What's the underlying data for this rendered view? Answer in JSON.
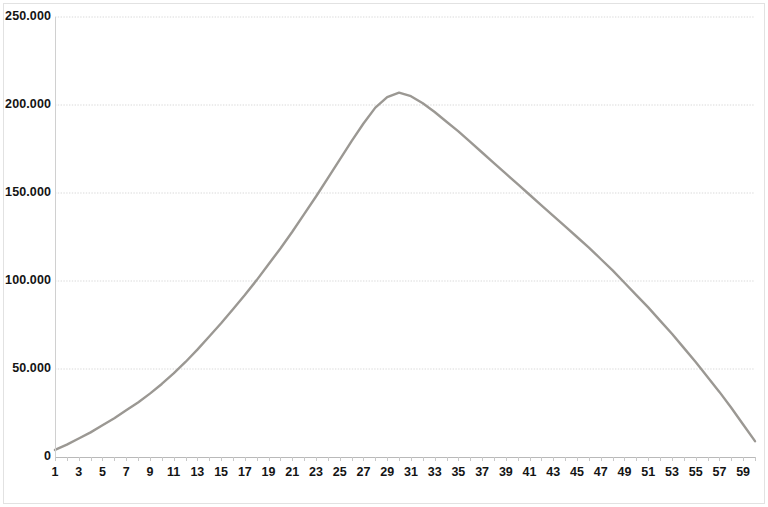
{
  "chart_data": {
    "type": "line",
    "title": "",
    "subtitle": "",
    "xlabel": "",
    "ylabel": "",
    "xlim": [
      1,
      60
    ],
    "ylim": [
      0,
      250000
    ],
    "grid": true,
    "legend": false,
    "legend_position": "none",
    "y_ticks": [
      0,
      50000,
      100000,
      150000,
      200000,
      250000
    ],
    "y_tick_labels": [
      "0",
      "50.000",
      "100.000",
      "150.000",
      "200.000",
      "250.000"
    ],
    "x_ticks": [
      1,
      2,
      3,
      4,
      5,
      6,
      7,
      8,
      9,
      10,
      11,
      12,
      13,
      14,
      15,
      16,
      17,
      18,
      19,
      20,
      21,
      22,
      23,
      24,
      25,
      26,
      27,
      28,
      29,
      30,
      31,
      32,
      33,
      34,
      35,
      36,
      37,
      38,
      39,
      40,
      41,
      42,
      43,
      44,
      45,
      46,
      47,
      48,
      49,
      50,
      51,
      52,
      53,
      54,
      55,
      56,
      57,
      58,
      59,
      60
    ],
    "x_tick_labels": [
      "1",
      "3",
      "5",
      "7",
      "9",
      "11",
      "13",
      "15",
      "17",
      "19",
      "21",
      "23",
      "25",
      "27",
      "29",
      "31",
      "33",
      "35",
      "37",
      "39",
      "41",
      "43",
      "45",
      "47",
      "49",
      "51",
      "53",
      "55",
      "57",
      "59"
    ],
    "x_tick_label_values": [
      1,
      3,
      5,
      7,
      9,
      11,
      13,
      15,
      17,
      19,
      21,
      23,
      25,
      27,
      29,
      31,
      33,
      35,
      37,
      39,
      41,
      43,
      45,
      47,
      49,
      51,
      53,
      55,
      57,
      59
    ],
    "series": [
      {
        "name": "series-1",
        "color": "#9b9893",
        "x": [
          1,
          2,
          3,
          4,
          5,
          6,
          7,
          8,
          9,
          10,
          11,
          12,
          13,
          14,
          15,
          16,
          17,
          18,
          19,
          20,
          21,
          22,
          23,
          24,
          25,
          26,
          27,
          28,
          29,
          30,
          31,
          32,
          33,
          34,
          35,
          36,
          37,
          38,
          39,
          40,
          41,
          42,
          43,
          44,
          45,
          46,
          47,
          48,
          49,
          50,
          51,
          52,
          53,
          54,
          55,
          56,
          57,
          58,
          59,
          60
        ],
        "values": [
          4000,
          7000,
          10500,
          14000,
          18000,
          22000,
          26500,
          31000,
          36000,
          41500,
          47500,
          54000,
          61000,
          68500,
          76000,
          84000,
          92000,
          100500,
          109500,
          118500,
          128000,
          138000,
          148000,
          158500,
          169000,
          179500,
          189500,
          198500,
          204500,
          207000,
          205000,
          201000,
          196000,
          190500,
          185000,
          179000,
          173000,
          167000,
          161000,
          155000,
          149000,
          143000,
          137000,
          131000,
          125000,
          119000,
          112500,
          106000,
          99000,
          92000,
          85000,
          77500,
          70000,
          62000,
          54000,
          45500,
          37000,
          28000,
          18500,
          9000
        ]
      }
    ],
    "peak": {
      "x": 30,
      "y": 207000
    },
    "line_color": "#9b9893",
    "gridline_color": "#d9d9d9",
    "background_color": "#ffffff",
    "axis_color": "#c8c8c8"
  }
}
